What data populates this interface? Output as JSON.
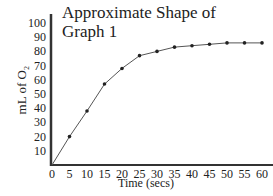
{
  "chart_data": {
    "type": "line",
    "title": "Approximate Shape of\nGraph 1",
    "xlabel": "Time (secs)",
    "ylabel": "mL of O₂",
    "x": [
      0,
      5,
      10,
      15,
      20,
      25,
      30,
      35,
      40,
      45,
      50,
      55,
      60
    ],
    "series": [
      {
        "name": "Graph 1",
        "values": [
          0,
          20,
          38,
          57,
          68,
          77,
          80,
          83,
          84,
          85,
          86,
          86,
          86
        ]
      }
    ],
    "xticks": [
      "0",
      "5",
      "10",
      "15",
      "20",
      "25",
      "30",
      "35",
      "40",
      "45",
      "50",
      "55",
      "60"
    ],
    "yticks": [
      "10",
      "20",
      "30",
      "40",
      "50",
      "60",
      "70",
      "80",
      "90",
      "100"
    ],
    "xlim": [
      0,
      60
    ],
    "ylim": [
      0,
      100
    ],
    "grid": false,
    "legend": null,
    "colors": {
      "line": "#555555",
      "marker": "#222222",
      "axis": "#333333"
    }
  }
}
